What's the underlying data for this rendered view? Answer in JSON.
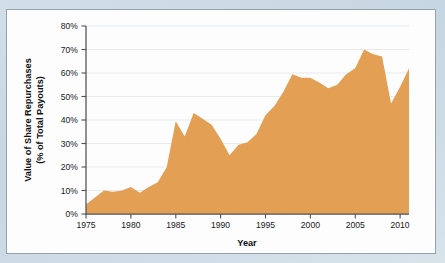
{
  "figure": {
    "background_color": "#ccdae4",
    "panel_color": "#fdfdfd",
    "panel_border_color": "#93a3ad"
  },
  "chart_data": {
    "type": "area",
    "title": "",
    "subtitle": "",
    "xlabel": "Year",
    "ylabel": "Value of Share Repurchases\n(% of Total Payouts)",
    "ylabel_line1": "Value of Share Repurchases",
    "ylabel_line2": "(% of Total Payouts)",
    "series_name": "Value of Share Repurchases (% of Total Payouts)",
    "fill_color": "#e3a055",
    "grid": "horizontal",
    "legend": "none",
    "xlim": [
      1975,
      2011
    ],
    "ylim": [
      0,
      80
    ],
    "xticks": [
      1975,
      1980,
      1985,
      1990,
      1995,
      2000,
      2005,
      2010
    ],
    "xtick_labels": [
      "1975",
      "1980",
      "1985",
      "1990",
      "1995",
      "2000",
      "2005",
      "2010"
    ],
    "yticks": [
      0,
      10,
      20,
      30,
      40,
      50,
      60,
      70,
      80
    ],
    "ytick_labels": [
      "0%",
      "10%",
      "20%",
      "30%",
      "40%",
      "50%",
      "60%",
      "70%",
      "80%"
    ],
    "x": [
      1975,
      1976,
      1977,
      1978,
      1979,
      1980,
      1981,
      1982,
      1983,
      1984,
      1985,
      1986,
      1987,
      1988,
      1989,
      1990,
      1991,
      1992,
      1993,
      1994,
      1995,
      1996,
      1997,
      1998,
      1999,
      2000,
      2001,
      2002,
      2003,
      2004,
      2005,
      2006,
      2007,
      2008,
      2009,
      2010,
      2011
    ],
    "values": [
      4,
      7,
      10,
      9.5,
      10,
      11.5,
      9,
      11.5,
      13.5,
      20,
      39.5,
      33,
      43,
      40.5,
      38,
      32,
      25,
      29.5,
      30.5,
      34,
      42,
      46,
      52,
      59.5,
      58,
      58,
      56,
      53.5,
      55,
      59.5,
      62,
      70,
      68,
      67,
      47,
      54,
      62
    ]
  }
}
